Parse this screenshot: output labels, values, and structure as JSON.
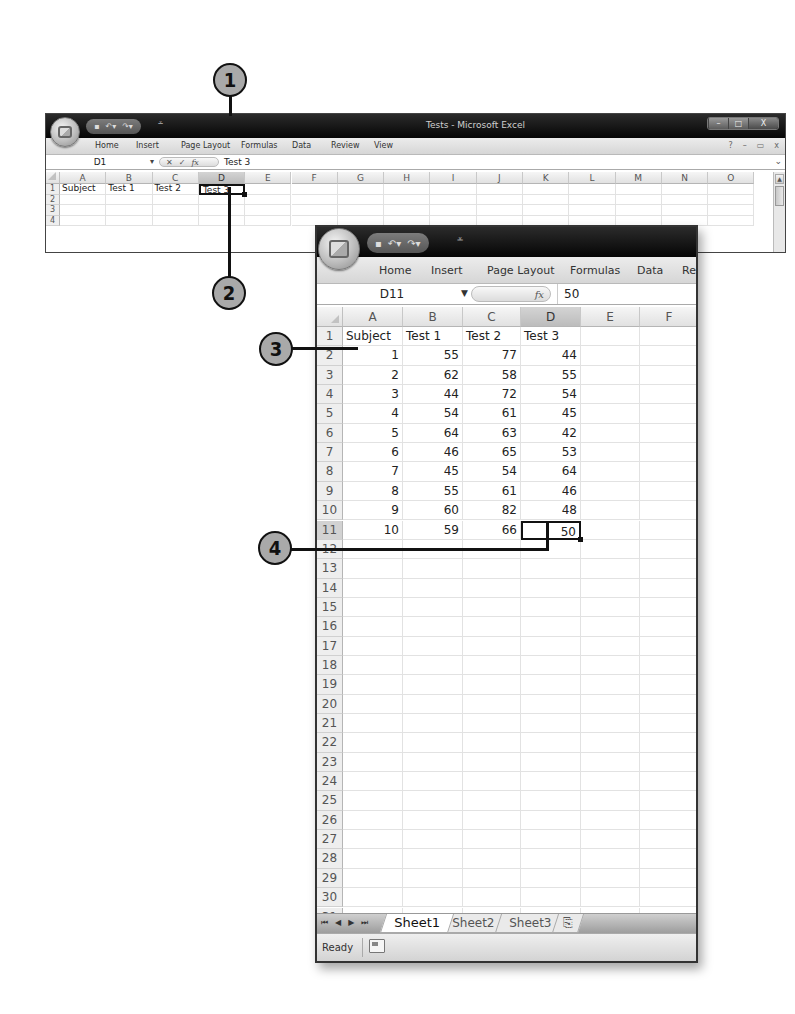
{
  "window1": {
    "title": "Tests - Microsoft Excel",
    "qat_icons": [
      "save-icon",
      "undo-icon",
      "redo-icon"
    ],
    "tabs": [
      "Home",
      "Insert",
      "Page Layout",
      "Formulas",
      "Data",
      "Review",
      "View"
    ],
    "window_controls": {
      "minimize": "–",
      "maximize": "□",
      "close": "X"
    },
    "ribbon_controls": {
      "help": "?",
      "minimize": "–",
      "restore": "▭",
      "close": "x"
    },
    "name_box": "D1",
    "formula_buttons": {
      "cancel": "✕",
      "enter": "✓",
      "fx": "fx"
    },
    "formula_value": "Test 3",
    "expand_glyph": "¥",
    "columns": [
      "A",
      "B",
      "C",
      "D",
      "E",
      "F",
      "G",
      "H",
      "I",
      "J",
      "K",
      "L",
      "M",
      "N",
      "O"
    ],
    "selected_column": "D",
    "rows": [
      "1",
      "2",
      "3",
      "4"
    ],
    "cells": {
      "A1": "Subject",
      "B1": "Test 1",
      "C1": "Test 2",
      "D1": "Test 3"
    },
    "active_cell": "D1"
  },
  "window2": {
    "tabs": [
      "Home",
      "Insert",
      "Page Layout",
      "Formulas",
      "Data",
      "Re"
    ],
    "name_box": "D11",
    "formula_fx": "fx",
    "formula_value": "50",
    "columns": [
      "A",
      "B",
      "C",
      "D",
      "E",
      "F"
    ],
    "selected_column": "D",
    "selected_row": "11",
    "header_row": [
      "Subject",
      "Test 1",
      "Test 2",
      "Test 3"
    ],
    "data_rows": [
      [
        "1",
        "55",
        "77",
        "44"
      ],
      [
        "2",
        "62",
        "58",
        "55"
      ],
      [
        "3",
        "44",
        "72",
        "54"
      ],
      [
        "4",
        "54",
        "61",
        "45"
      ],
      [
        "5",
        "64",
        "63",
        "42"
      ],
      [
        "6",
        "46",
        "65",
        "53"
      ],
      [
        "7",
        "45",
        "54",
        "64"
      ],
      [
        "8",
        "55",
        "61",
        "46"
      ],
      [
        "9",
        "60",
        "82",
        "48"
      ],
      [
        "10",
        "59",
        "66",
        "50"
      ]
    ],
    "row_count": 32,
    "active_cell": "D11",
    "sheet_nav": [
      "⏮",
      "◀",
      "▶",
      "⏭"
    ],
    "sheets": [
      "Sheet1",
      "Sheet2",
      "Sheet3"
    ],
    "active_sheet": "Sheet1",
    "insert_sheet_icon": "insert-sheet-icon",
    "status": "Ready"
  },
  "callouts": [
    "1",
    "2",
    "3",
    "4"
  ]
}
